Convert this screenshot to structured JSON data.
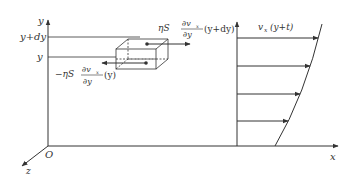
{
  "diagram": {
    "axes": {
      "y_label": "y",
      "x_label": "x",
      "z_label": "z",
      "origin_label": "O"
    },
    "levels": {
      "upper": "y+dy",
      "lower": "y"
    },
    "forces": {
      "top": {
        "prefix": "ηS",
        "num": "∂v",
        "num_sub": "x",
        "den": "∂y",
        "arg": "(y+dy)"
      },
      "bottom": {
        "prefix": "−ηS",
        "num": "∂v",
        "num_sub": "x",
        "den": "∂y",
        "arg": "(y)"
      }
    },
    "profile": {
      "label_v": "v",
      "label_sub": "x",
      "label_arg": "(y+t)",
      "arrow_count": 4
    },
    "colors": {
      "line": "#333333",
      "background": "#ffffff"
    }
  }
}
